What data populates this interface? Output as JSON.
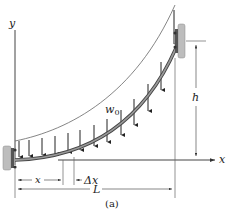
{
  "figure": {
    "caption": "(a)",
    "type": "cable with distributed load"
  },
  "labels": {
    "y_axis": "y",
    "x_axis": "x",
    "load": "w",
    "load_subscript": "0",
    "height": "h",
    "position": "x",
    "increment": "Δx",
    "span": "L"
  },
  "colors": {
    "line": "#333333",
    "beam": "#6f6f6f",
    "beam_edge": "#444444",
    "wall": "#bdbdbd",
    "wall_dark": "#555555",
    "dimension": "#555555"
  }
}
